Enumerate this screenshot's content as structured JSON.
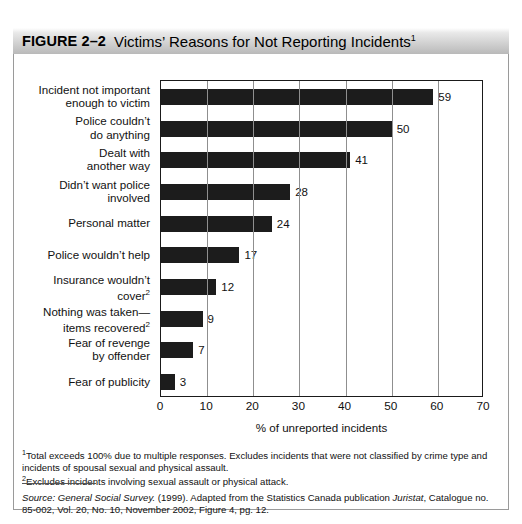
{
  "figure": {
    "label": "FIGURE 2–2",
    "title": "Victims’ Reasons for Not Reporting Incidents",
    "title_superscript": "1"
  },
  "chart_data": {
    "type": "bar",
    "orientation": "horizontal",
    "title": "Victims’ Reasons for Not Reporting Incidents",
    "xlabel": "% of unreported incidents",
    "ylabel": "",
    "xlim": [
      0,
      70
    ],
    "xticks": [
      0,
      10,
      20,
      30,
      40,
      50,
      60,
      70
    ],
    "grid": "vertical",
    "legend": "none",
    "bar_color": "#1c1c1c",
    "categories": [
      "Incident not important\nenough to victim",
      "Police couldn’t\ndo anything",
      "Dealt with\nanother way",
      "Didn’t want police\ninvolved",
      "Personal matter",
      "Police wouldn’t help",
      "Insurance wouldn’t\ncover",
      "Nothing was taken—\nitems recovered",
      "Fear of revenge\nby offender",
      "Fear of publicity"
    ],
    "category_superscripts": [
      "",
      "",
      "",
      "",
      "",
      "",
      "2",
      "2",
      "",
      ""
    ],
    "values": [
      59,
      50,
      41,
      28,
      24,
      17,
      12,
      9,
      7,
      3
    ],
    "value_labels": [
      "59",
      "50",
      "41",
      "28",
      "24",
      "17",
      "12",
      "9",
      "7",
      "3"
    ]
  },
  "xticks": [
    "0",
    "10",
    "20",
    "30",
    "40",
    "50",
    "60",
    "70"
  ],
  "xaxis_title": "% of unreported incidents",
  "footnotes": {
    "one_marker": "1",
    "one_text": "Total exceeds 100% due to multiple responses. Excludes incidents that were not classified by crime type and incidents of spousal sexual and physical assault.",
    "two_marker": "2",
    "two_text": "Excludes incidents involving sexual assault or physical attack."
  },
  "source": {
    "prefix": "Source:",
    "publication": "General Social Survey.",
    "mid": "(1999). Adapted from the Statistics Canada publication",
    "juristat": "Juristat",
    "suffix": ", Catalogue no. 85-002, Vol. 20, No. 10, November 2002, Figure 4, pg. 12."
  }
}
